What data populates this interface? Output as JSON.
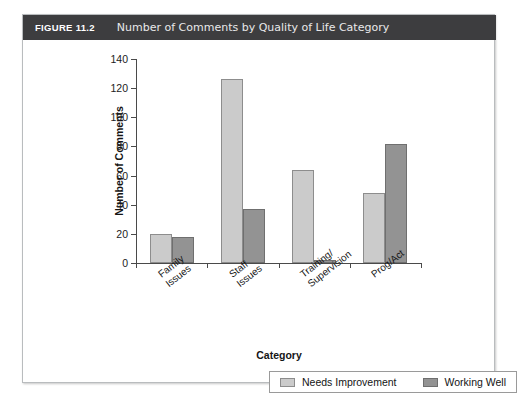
{
  "figure": {
    "number": "FIGURE 11.2",
    "caption": "Number of Comments by Quality of Life Category"
  },
  "chart_data": {
    "type": "bar",
    "title": "Number of Comments by Quality of Life Category",
    "xlabel": "Category",
    "ylabel": "Number of Comments",
    "ylim": [
      0,
      140
    ],
    "yticks": [
      0,
      20,
      40,
      60,
      80,
      100,
      120,
      140
    ],
    "grid": false,
    "legend_position": "bottom",
    "categories": [
      "Family Issues",
      "Staff Issues",
      "Training/ Supervision",
      "Prog/Act"
    ],
    "category_lines": [
      [
        "Family",
        "Issues"
      ],
      [
        "Staff",
        "Issues"
      ],
      [
        "Training/",
        "Supervision"
      ],
      [
        "Prog/Act"
      ]
    ],
    "series": [
      {
        "name": "Needs Improvement",
        "color": "#cbcbcb",
        "values": [
          20,
          126,
          64,
          48
        ]
      },
      {
        "name": "Working Well",
        "color": "#939393",
        "values": [
          18,
          37,
          2,
          82
        ]
      }
    ]
  }
}
